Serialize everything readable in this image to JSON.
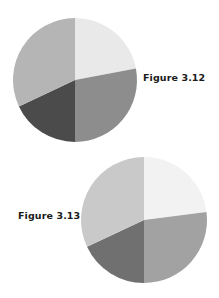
{
  "figures": [
    {
      "label": "Figure 3.12"
    },
    {
      "label": "Figure 3.13"
    }
  ],
  "chart_data": [
    {
      "type": "pie",
      "title": "Figure 3.12",
      "categories": [
        "Slice A",
        "Slice B",
        "Slice C",
        "Slice D"
      ],
      "values": [
        22,
        28,
        18,
        32
      ],
      "colors": [
        "#e9e9e9",
        "#8d8d8d",
        "#4b4b4b",
        "#b5b5b5"
      ],
      "start_angle_deg": 0,
      "direction": "clockwise",
      "center": [
        75,
        80
      ],
      "radius": 62,
      "legend": "none",
      "data_labels": "none"
    },
    {
      "type": "pie",
      "title": "Figure 3.13",
      "categories": [
        "Slice A",
        "Slice B",
        "Slice C",
        "Slice D"
      ],
      "values": [
        23,
        27,
        18,
        32
      ],
      "colors": [
        "#f2f2f2",
        "#a2a2a2",
        "#707070",
        "#c9c9c9"
      ],
      "start_angle_deg": 0,
      "direction": "clockwise",
      "center": [
        144,
        220
      ],
      "radius": 63,
      "legend": "none",
      "data_labels": "none"
    }
  ]
}
